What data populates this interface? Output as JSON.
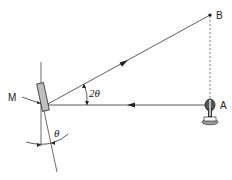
{
  "diagram": {
    "type": "optics-rotating-mirror",
    "labels": {
      "mirror": "M",
      "source": "A",
      "target": "B",
      "reflection_angle": "2θ",
      "mirror_angle": "θ"
    },
    "colors": {
      "line": "#333333",
      "mirror_fill": "#bfbfbf",
      "lamp": "#444444"
    }
  }
}
